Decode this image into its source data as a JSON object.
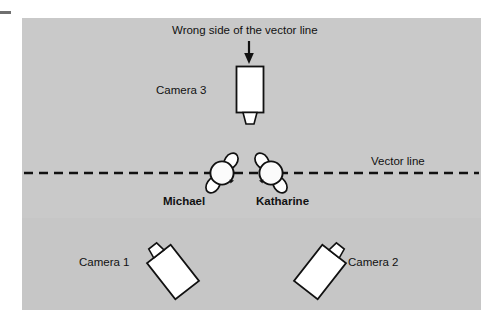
{
  "figure": {
    "type": "diagram",
    "background_color": "#ffffff",
    "stage_color": "#c9c9c9",
    "ink_color": "#111111",
    "shape_fill": "#ffffff"
  },
  "annotations": {
    "wrong_side_caption": "Wrong side of the vector line",
    "vector_line_label": "Vector line"
  },
  "cameras": [
    {
      "id": "camera-1",
      "label": "Camera 1"
    },
    {
      "id": "camera-2",
      "label": "Camera 2"
    },
    {
      "id": "camera-3",
      "label": "Camera 3"
    }
  ],
  "people": [
    {
      "id": "person-michael",
      "label": "Michael"
    },
    {
      "id": "person-katharine",
      "label": "Katharine"
    }
  ],
  "vector_line": {
    "style": "dashed",
    "dash_length": 9,
    "gap_length": 6,
    "y": 173,
    "x_start": 24,
    "x_end": 479
  }
}
